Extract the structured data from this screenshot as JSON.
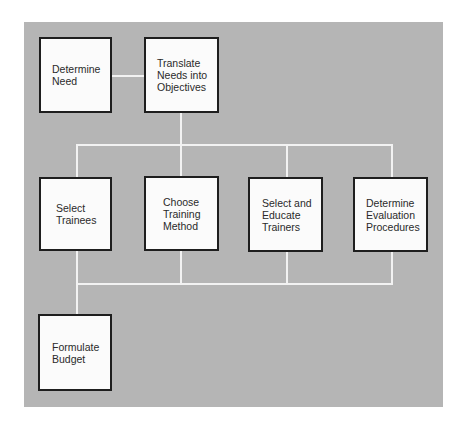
{
  "diagram": {
    "type": "flowchart",
    "background_color": "#b5b5b5",
    "connector_color": "#f2f2f2",
    "box_border_color": "#1e1e1e",
    "nodes": [
      {
        "id": "determine-need",
        "lines": [
          "Determine",
          "Need"
        ]
      },
      {
        "id": "translate-needs",
        "lines": [
          "Translate",
          "Needs into",
          "Objectives"
        ]
      },
      {
        "id": "select-trainees",
        "lines": [
          "Select",
          "Trainees"
        ]
      },
      {
        "id": "choose-training-method",
        "lines": [
          "Choose",
          "Training",
          "Method"
        ]
      },
      {
        "id": "select-educate-trainers",
        "lines": [
          "Select and",
          "Educate",
          "Trainers"
        ]
      },
      {
        "id": "determine-evaluation",
        "lines": [
          "Determine",
          "Evaluation",
          "Procedures"
        ]
      },
      {
        "id": "formulate-budget",
        "lines": [
          "Formulate",
          "Budget"
        ]
      }
    ],
    "edges": [
      {
        "from": "determine-need",
        "to": "translate-needs"
      },
      {
        "from": "translate-needs",
        "to": "select-trainees"
      },
      {
        "from": "translate-needs",
        "to": "choose-training-method"
      },
      {
        "from": "translate-needs",
        "to": "select-educate-trainers"
      },
      {
        "from": "translate-needs",
        "to": "determine-evaluation"
      },
      {
        "from": "select-trainees",
        "to": "formulate-budget"
      },
      {
        "from": "choose-training-method",
        "to": "formulate-budget"
      },
      {
        "from": "select-educate-trainers",
        "to": "formulate-budget"
      },
      {
        "from": "determine-evaluation",
        "to": "formulate-budget"
      }
    ]
  }
}
